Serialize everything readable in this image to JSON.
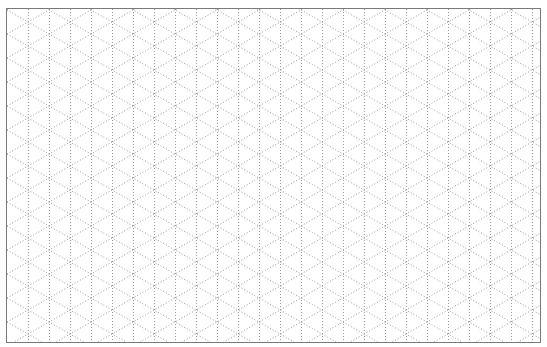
{
  "canvas": {
    "type": "isometric-dot-grid",
    "width": 535,
    "height": 335,
    "offset_x": 6,
    "offset_y": 8,
    "grid": {
      "vertical_spacing_px": 21,
      "diagonal_period_px": 24,
      "first_vertical_x": 21,
      "line_style": "dotted",
      "line_color": "#9a9a9a",
      "line_dash": "1,2"
    },
    "border_color": "#7a7a7a",
    "background_color": "#ffffff"
  }
}
